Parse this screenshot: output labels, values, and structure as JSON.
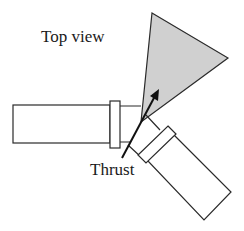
{
  "diagram": {
    "title": "Top view",
    "arrow_label": "Thrust",
    "colors": {
      "stroke": "#2a2a2a",
      "cone_fill": "#d0d0d0",
      "background": "#ffffff"
    },
    "elements": [
      {
        "name": "left-cylinder",
        "type": "cylinder",
        "orientation": "horizontal"
      },
      {
        "name": "right-cylinder",
        "type": "cylinder",
        "orientation": "diagonal"
      },
      {
        "name": "spray-cone",
        "type": "triangle",
        "fill": "gray"
      },
      {
        "name": "thrust-arrow",
        "type": "arrow"
      }
    ]
  }
}
